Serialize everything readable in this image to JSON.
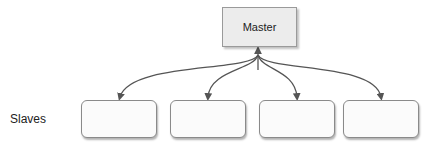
{
  "diagram": {
    "master": {
      "label": "Master"
    },
    "slaves_label": "Slaves",
    "slaves": [
      {
        "label": ""
      },
      {
        "label": ""
      },
      {
        "label": ""
      },
      {
        "label": ""
      }
    ],
    "edge_color": "#555555",
    "edges": "bidirectional arrows from Master to each slave"
  }
}
